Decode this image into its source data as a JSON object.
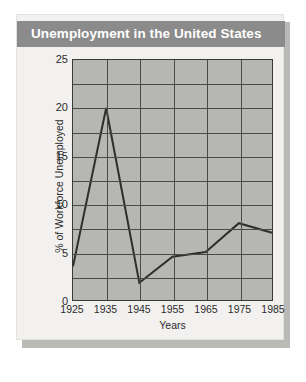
{
  "card": {
    "title": "Unemployment in the United States",
    "title_bg": "#8b8b8b",
    "title_color": "#ffffff",
    "background": "#f2f1ef"
  },
  "chart_data": {
    "type": "line",
    "title": "Unemployment in the United States",
    "xlabel": "Years",
    "ylabel": "% of Workforce Unemployed",
    "x": [
      1925,
      1935,
      1945,
      1955,
      1965,
      1975,
      1985
    ],
    "categories": [
      "1925",
      "1935",
      "1945",
      "1955",
      "1965",
      "1975",
      "1985"
    ],
    "values": [
      3.5,
      20,
      1.8,
      4.5,
      5,
      8,
      7
    ],
    "series": [
      {
        "name": "% of Workforce Unemployed",
        "values": [
          3.5,
          20,
          1.8,
          4.5,
          5,
          8,
          7
        ]
      }
    ],
    "xlim": [
      1925,
      1985
    ],
    "ylim": [
      0,
      25
    ],
    "ytick_labels": [
      "0",
      "5",
      "10",
      "15",
      "20",
      "25"
    ],
    "ytick_values": [
      0,
      5,
      10,
      15,
      20,
      25
    ],
    "xtick_labels": [
      "1925",
      "1935",
      "1945",
      "1955",
      "1965",
      "1975",
      "1985"
    ],
    "y_gridline_step": 2.5,
    "grid": true,
    "legend": "none",
    "plot_bg": "#b6b6b3",
    "line_color": "#2e2e2e"
  }
}
